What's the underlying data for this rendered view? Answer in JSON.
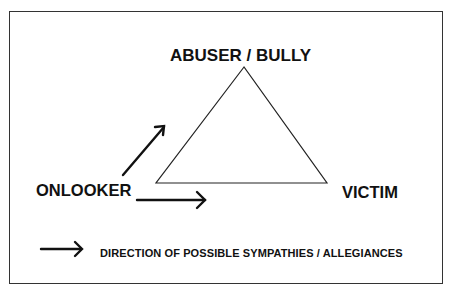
{
  "diagram": {
    "nodes": {
      "top": "ABUSER / BULLY",
      "left": "ONLOOKER",
      "right": "VICTIM"
    },
    "edges": [
      {
        "from": "ONLOOKER",
        "to": "ABUSER / BULLY",
        "type": "arrow"
      },
      {
        "from": "ONLOOKER",
        "to": "VICTIM",
        "type": "arrow"
      }
    ],
    "shape": "triangle",
    "legend": {
      "symbol": "arrow-right-icon",
      "text": "DIRECTION OF POSSIBLE SYMPATHIES / ALLEGIANCES"
    }
  }
}
